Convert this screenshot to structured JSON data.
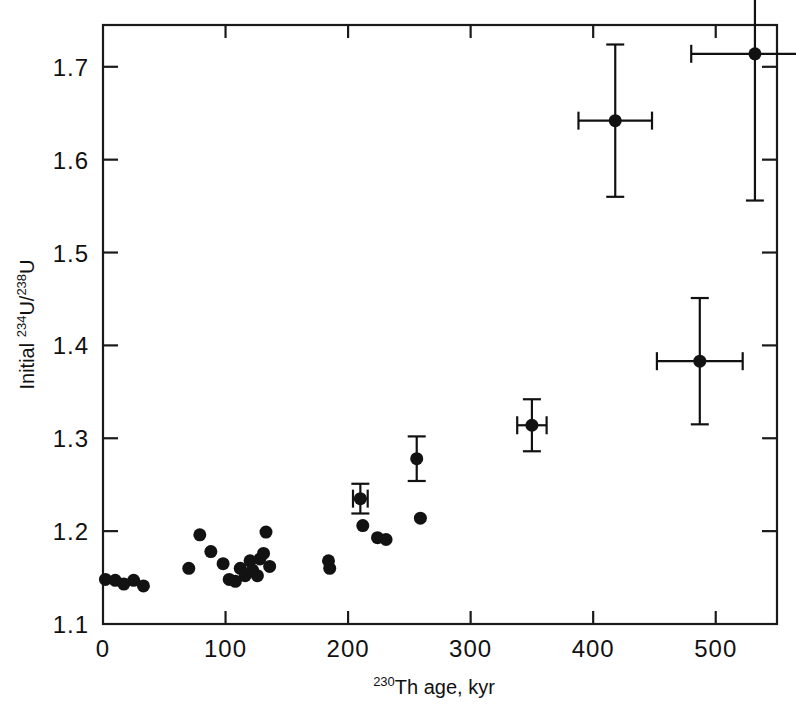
{
  "figure": {
    "background": "#ffffff",
    "ink_color": "#121212"
  },
  "chart_data": {
    "type": "scatter",
    "title": "",
    "xlabel": "230Th age, kyr",
    "xlabel_parts": {
      "sup": "230",
      "rest": "Th age, kyr"
    },
    "ylabel": "Initial 234U/238U",
    "ylabel_parts": {
      "lead": "Initial ",
      "sup1": "234",
      "mid": "U/",
      "sup2": "238",
      "tail": "U"
    },
    "xlim": [
      0,
      550
    ],
    "ylim": [
      1.1,
      1.745
    ],
    "xticks": [
      0,
      100,
      200,
      300,
      400,
      500
    ],
    "xticklabels": [
      "0",
      "100",
      "200",
      "300",
      "400",
      "500"
    ],
    "yticks": [
      1.1,
      1.2,
      1.3,
      1.4,
      1.5,
      1.6,
      1.7
    ],
    "yticklabels": [
      "1.1",
      "1.2",
      "1.3",
      "1.4",
      "1.5",
      "1.6",
      "1.7"
    ],
    "grid": false,
    "legend": null,
    "marker": "filled-circle",
    "marker_size_px": 13,
    "points": [
      {
        "x": 2,
        "y": 1.148
      },
      {
        "x": 10,
        "y": 1.147
      },
      {
        "x": 17,
        "y": 1.143
      },
      {
        "x": 25,
        "y": 1.147
      },
      {
        "x": 33,
        "y": 1.141
      },
      {
        "x": 70,
        "y": 1.16
      },
      {
        "x": 79,
        "y": 1.196
      },
      {
        "x": 88,
        "y": 1.178
      },
      {
        "x": 98,
        "y": 1.165
      },
      {
        "x": 103,
        "y": 1.148
      },
      {
        "x": 108,
        "y": 1.146
      },
      {
        "x": 112,
        "y": 1.16
      },
      {
        "x": 116,
        "y": 1.152
      },
      {
        "x": 120,
        "y": 1.168
      },
      {
        "x": 122,
        "y": 1.158
      },
      {
        "x": 126,
        "y": 1.152
      },
      {
        "x": 128,
        "y": 1.17
      },
      {
        "x": 131,
        "y": 1.176
      },
      {
        "x": 133,
        "y": 1.199
      },
      {
        "x": 136,
        "y": 1.162
      },
      {
        "x": 184,
        "y": 1.168
      },
      {
        "x": 185,
        "y": 1.16
      },
      {
        "x": 210,
        "y": 1.235,
        "xerr": 6,
        "yerr": 0.016
      },
      {
        "x": 212,
        "y": 1.206
      },
      {
        "x": 224,
        "y": 1.193
      },
      {
        "x": 231,
        "y": 1.191
      },
      {
        "x": 256,
        "y": 1.278,
        "xerr": 0,
        "yerr": 0.024
      },
      {
        "x": 259,
        "y": 1.214
      },
      {
        "x": 350,
        "y": 1.314,
        "xerr": 12,
        "yerr": 0.028
      },
      {
        "x": 418,
        "y": 1.642,
        "xerr": 30,
        "yerr": 0.082
      },
      {
        "x": 487,
        "y": 1.383,
        "xerr": 35,
        "yerr": 0.068
      },
      {
        "x": 532,
        "y": 1.714,
        "xerr": 52,
        "yerr": 0.158
      }
    ]
  }
}
